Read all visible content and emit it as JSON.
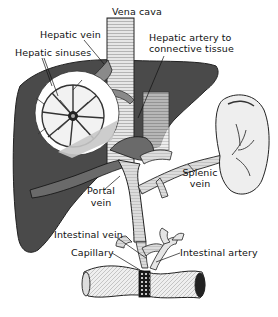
{
  "figure": {
    "labels": {
      "vena_cava": "Vena cava",
      "hepatic_vein": "Hepatic vein",
      "hepatic_sinuses": "Hepatic sinuses",
      "hepatic_artery_line1": "Hepatic artery to",
      "hepatic_artery_line2": "connective tissue",
      "splenic_vein_line1": "Splenic",
      "splenic_vein_line2": "vein",
      "portal_vein_line1": "Portal",
      "portal_vein_line2": "vein",
      "intestinal_vein": "Intestinal vein",
      "capillary": "Capillary",
      "intestinal_artery": "Intestinal artery"
    },
    "structures": [
      "liver",
      "vena cava",
      "hepatic vein",
      "hepatic sinuses (magnified lobule)",
      "hepatic artery",
      "portal vein",
      "spleen",
      "splenic vein",
      "intestine",
      "intestinal vein",
      "intestinal artery",
      "capillary"
    ],
    "colors": {
      "liver": "#4a4a4a",
      "vessel_fill": "#d8d8d8",
      "lobule_bg": "#ffffff",
      "ink": "#111111",
      "background": "#ffffff"
    },
    "caption_truncated": true
  }
}
